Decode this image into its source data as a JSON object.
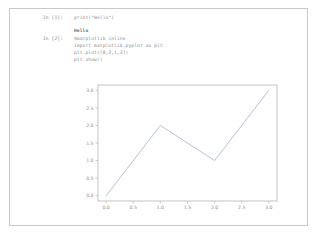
{
  "notebook": {
    "cells": [
      {
        "prompt": "In [1]:",
        "source": "print(\"Hello\")",
        "output": "Hello"
      },
      {
        "prompt": "In [2]:",
        "source": "%matplotlib inline\nimport matplotlib.pyplot as plt\nplt.plot([0,2,1,3])\nplt.show()"
      }
    ]
  },
  "chart_data": {
    "type": "line",
    "title": "",
    "xlabel": "",
    "ylabel": "",
    "x": [
      0,
      1,
      2,
      3
    ],
    "values": [
      0,
      2,
      1,
      3
    ],
    "series": [
      {
        "name": "plot([0,2,1,3])",
        "values": [
          0,
          2,
          1,
          3
        ]
      }
    ],
    "xlim": [
      -0.15,
      3.15
    ],
    "ylim": [
      -0.15,
      3.15
    ],
    "xticks": [
      "0.0",
      "0.5",
      "1.0",
      "1.5",
      "2.0",
      "2.5",
      "3.0"
    ],
    "xtick_values": [
      0.0,
      0.5,
      1.0,
      1.5,
      2.0,
      2.5,
      3.0
    ],
    "yticks": [
      "0.0",
      "0.5",
      "1.0",
      "1.5",
      "2.0",
      "2.5",
      "3.0"
    ],
    "ytick_values": [
      0.0,
      0.5,
      1.0,
      1.5,
      2.0,
      2.5,
      3.0
    ],
    "grid": false,
    "legend": false,
    "line_color": "#aab6cc"
  }
}
